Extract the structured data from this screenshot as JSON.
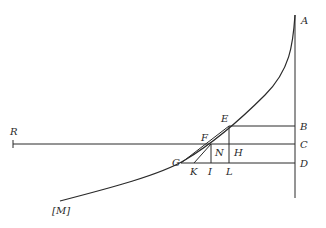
{
  "diagram": {
    "type": "geometric-construction",
    "colors": {
      "ink": "#2a2a2a",
      "background": "#ffffff"
    },
    "labels": {
      "A": "A",
      "B": "B",
      "C": "C",
      "D": "D",
      "E": "E",
      "F": "F",
      "G": "G",
      "H": "H",
      "I": "I",
      "K": "K",
      "L": "L",
      "N": "N",
      "R": "R",
      "M": "[M]"
    },
    "elements": [
      {
        "id": "axis-vertical",
        "desc": "vertical line through A, B, C, D"
      },
      {
        "id": "curve-AM",
        "desc": "curve from A descending to [M]"
      },
      {
        "id": "line-RC",
        "desc": "horizontal line from R to C"
      },
      {
        "id": "line-EB",
        "desc": "horizontal line from E to B"
      },
      {
        "id": "line-GD",
        "desc": "horizontal line from G to D"
      },
      {
        "id": "line-EL",
        "desc": "vertical line from E to L"
      },
      {
        "id": "line-NI",
        "desc": "vertical line from N to I"
      },
      {
        "id": "chord-GE",
        "desc": "straight line from G to E"
      },
      {
        "id": "line-KN",
        "desc": "straight line from K to N"
      }
    ]
  }
}
